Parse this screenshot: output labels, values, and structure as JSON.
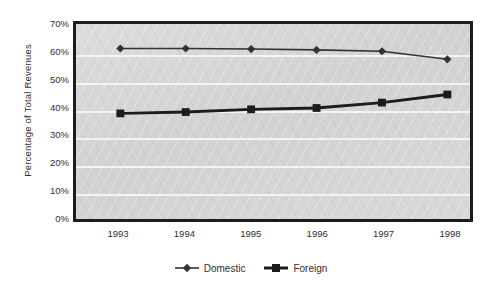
{
  "chart_data": {
    "type": "line",
    "title": "",
    "xlabel": "",
    "ylabel": "Percentage of Total Revenues",
    "categories": [
      "1993",
      "1994",
      "1995",
      "1996",
      "1997",
      "1998"
    ],
    "ylim": [
      0,
      70
    ],
    "ytick_labels": [
      "70%",
      "60%",
      "50%",
      "40%",
      "30%",
      "20%",
      "10%",
      "0%"
    ],
    "ytick_values": [
      70,
      60,
      50,
      40,
      30,
      20,
      10,
      0
    ],
    "grid": true,
    "legend_position": "bottom-center",
    "series": [
      {
        "name": "Domestic",
        "marker": "diamond",
        "color": "#333333",
        "line_width": 1.6,
        "values": [
          62.0,
          62.0,
          61.8,
          61.5,
          61.0,
          58.0
        ]
      },
      {
        "name": "Foreign",
        "marker": "square",
        "color": "#1c1c1c",
        "line_width": 3.0,
        "values": [
          38.0,
          38.5,
          39.5,
          40.0,
          42.0,
          45.0
        ]
      }
    ]
  },
  "colors": {
    "plot_background": "#d6d6d6",
    "frame_border": "#1c1c1c",
    "gridline": "#f4f4f4",
    "page_background": "#ffffff",
    "text": "#2f2f2f"
  }
}
